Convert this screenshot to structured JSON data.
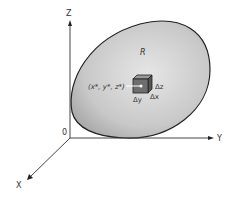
{
  "diagram": {
    "axes": {
      "z": "Z",
      "y": "Y",
      "x": "X",
      "origin": "0"
    },
    "region_label": "R",
    "point_label": "(x*, y*, z*)",
    "deltas": {
      "dz": "Δz",
      "dy": "Δy",
      "dx": "Δx"
    },
    "colors": {
      "region_fill": "#c9c9c9",
      "box_fill": "#6e6e6e",
      "axis": "#333333"
    }
  }
}
